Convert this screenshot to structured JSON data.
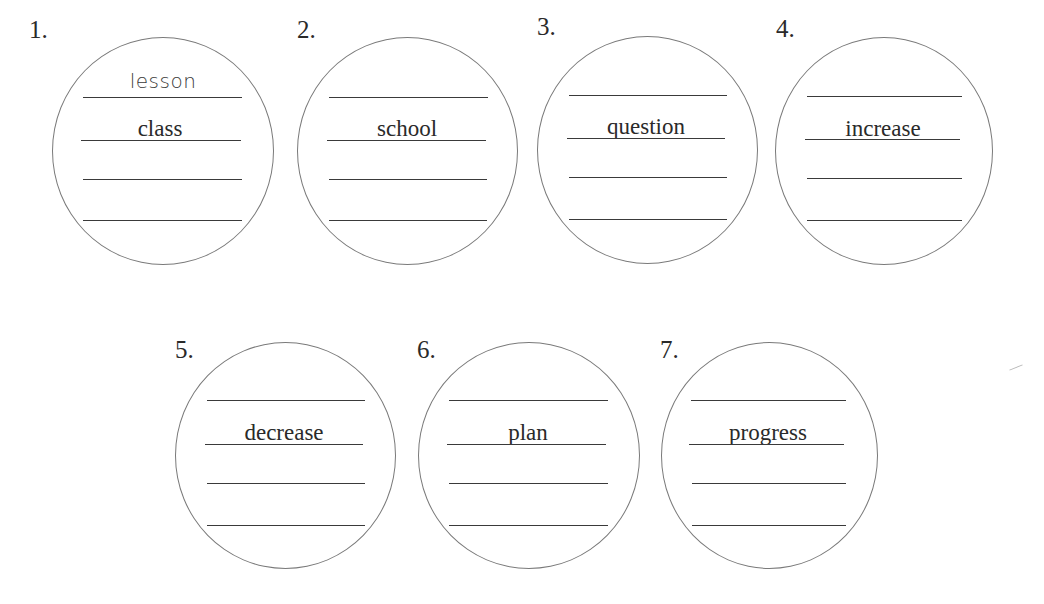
{
  "worksheet": {
    "items": [
      {
        "number": "1.",
        "word": "class",
        "handwritten_answer": "lesson",
        "blank_lines": 4
      },
      {
        "number": "2.",
        "word": "school",
        "handwritten_answer": "",
        "blank_lines": 4
      },
      {
        "number": "3.",
        "word": "question",
        "handwritten_answer": "",
        "blank_lines": 4
      },
      {
        "number": "4.",
        "word": "increase",
        "handwritten_answer": "",
        "blank_lines": 4
      },
      {
        "number": "5.",
        "word": "decrease",
        "handwritten_answer": "",
        "blank_lines": 4
      },
      {
        "number": "6.",
        "word": "plan",
        "handwritten_answer": "",
        "blank_lines": 4
      },
      {
        "number": "7.",
        "word": "progress",
        "handwritten_answer": "",
        "blank_lines": 4
      }
    ]
  }
}
